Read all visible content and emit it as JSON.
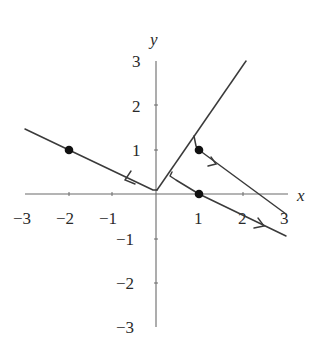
{
  "figure": {
    "type": "phase-portrait",
    "axes": {
      "x_label": "x",
      "y_label": "y",
      "x_ticks": [
        {
          "value": -3,
          "label": "−3"
        },
        {
          "value": -2,
          "label": "−2"
        },
        {
          "value": -1,
          "label": "−1"
        },
        {
          "value": 1,
          "label": "1"
        },
        {
          "value": 2,
          "label": "2"
        },
        {
          "value": 3,
          "label": "3"
        }
      ],
      "y_ticks": [
        {
          "value": 3,
          "label": "3"
        },
        {
          "value": 2,
          "label": "2"
        },
        {
          "value": 1,
          "label": "1"
        },
        {
          "value": -1,
          "label": "−1"
        },
        {
          "value": -2,
          "label": "−2"
        },
        {
          "value": -3,
          "label": "−3"
        }
      ],
      "x_range": [
        -3,
        3
      ],
      "y_range": [
        -3,
        3
      ]
    },
    "points": [
      {
        "name": "initial-point-left",
        "x": -2,
        "y": 1
      },
      {
        "name": "initial-point-upper-right",
        "x": 1,
        "y": 1
      },
      {
        "name": "initial-point-on-x-axis",
        "x": 1,
        "y": 0
      }
    ],
    "curves": [
      {
        "name": "switching-ray",
        "description": "ray from origin toward upper right",
        "from": [
          0,
          0.1
        ],
        "to": [
          2.07,
          3
        ]
      },
      {
        "name": "trajectory-left",
        "description": "line through (-2,1) moving left-to-origin, arrow pointing left",
        "from": [
          -3,
          1.47
        ],
        "to": [
          0.02,
          0.1
        ],
        "arrow": "left"
      },
      {
        "name": "trajectory-lower",
        "description": "starts on ray, passes through (1,0), heads down-right",
        "from": [
          0.37,
          0.5
        ],
        "to": [
          3,
          -0.95
        ],
        "arrow": "right"
      },
      {
        "name": "trajectory-upper",
        "description": "starts on ray, passes through (1,1), heads down-right",
        "from": [
          0.95,
          1.22
        ],
        "to": [
          3,
          0.45
        ],
        "arrow": "right"
      }
    ]
  }
}
